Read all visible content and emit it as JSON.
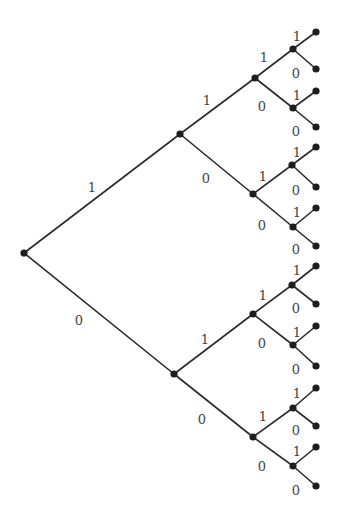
{
  "diagram": {
    "type": "binary-tree",
    "orientation": "left-to-right",
    "depth": 4,
    "colors": {
      "edge": "#2a2a2a",
      "node": "#1e1e1e",
      "label": "#444444"
    },
    "nodes": [
      {
        "id": "r",
        "x": 24,
        "y": 253
      },
      {
        "id": "1",
        "x": 180,
        "y": 134
      },
      {
        "id": "0",
        "x": 174,
        "y": 374
      },
      {
        "id": "11",
        "x": 255,
        "y": 78
      },
      {
        "id": "10",
        "x": 253,
        "y": 194
      },
      {
        "id": "01",
        "x": 253,
        "y": 314
      },
      {
        "id": "00",
        "x": 253,
        "y": 437
      },
      {
        "id": "111",
        "x": 293,
        "y": 49
      },
      {
        "id": "110",
        "x": 293,
        "y": 108
      },
      {
        "id": "101",
        "x": 292,
        "y": 165
      },
      {
        "id": "100",
        "x": 293,
        "y": 227
      },
      {
        "id": "011",
        "x": 292,
        "y": 285
      },
      {
        "id": "010",
        "x": 293,
        "y": 345
      },
      {
        "id": "001",
        "x": 293,
        "y": 408
      },
      {
        "id": "000",
        "x": 293,
        "y": 466
      },
      {
        "id": "1111",
        "x": 316,
        "y": 32
      },
      {
        "id": "1110",
        "x": 316,
        "y": 69
      },
      {
        "id": "1101",
        "x": 316,
        "y": 91
      },
      {
        "id": "1100",
        "x": 316,
        "y": 127
      },
      {
        "id": "1011",
        "x": 316,
        "y": 147
      },
      {
        "id": "1010",
        "x": 316,
        "y": 187
      },
      {
        "id": "1001",
        "x": 316,
        "y": 208
      },
      {
        "id": "1000",
        "x": 316,
        "y": 246
      },
      {
        "id": "0111",
        "x": 316,
        "y": 266
      },
      {
        "id": "0110",
        "x": 316,
        "y": 304
      },
      {
        "id": "0101",
        "x": 316,
        "y": 326
      },
      {
        "id": "0100",
        "x": 316,
        "y": 366
      },
      {
        "id": "0011",
        "x": 316,
        "y": 388
      },
      {
        "id": "0010",
        "x": 316,
        "y": 426
      },
      {
        "id": "0001",
        "x": 316,
        "y": 447
      },
      {
        "id": "0000",
        "x": 316,
        "y": 486
      }
    ],
    "edges": [
      {
        "from": "r",
        "to": "1",
        "label": "1",
        "lx": 92,
        "ly": 188
      },
      {
        "from": "r",
        "to": "0",
        "label": "0",
        "lx": 79,
        "ly": 321
      },
      {
        "from": "1",
        "to": "11",
        "label": "1",
        "lx": 207,
        "ly": 101
      },
      {
        "from": "1",
        "to": "10",
        "label": "0",
        "lx": 206,
        "ly": 179
      },
      {
        "from": "0",
        "to": "01",
        "label": "1",
        "lx": 205,
        "ly": 340
      },
      {
        "from": "0",
        "to": "00",
        "label": "0",
        "lx": 202,
        "ly": 420
      },
      {
        "from": "11",
        "to": "111",
        "label": "1",
        "lx": 264,
        "ly": 58
      },
      {
        "from": "11",
        "to": "110",
        "label": "0",
        "lx": 262,
        "ly": 107
      },
      {
        "from": "10",
        "to": "101",
        "label": "1",
        "lx": 263,
        "ly": 177
      },
      {
        "from": "10",
        "to": "100",
        "label": "0",
        "lx": 262,
        "ly": 226
      },
      {
        "from": "01",
        "to": "011",
        "label": "1",
        "lx": 263,
        "ly": 296
      },
      {
        "from": "01",
        "to": "010",
        "label": "0",
        "lx": 262,
        "ly": 344
      },
      {
        "from": "00",
        "to": "001",
        "label": "1",
        "lx": 263,
        "ly": 417
      },
      {
        "from": "00",
        "to": "000",
        "label": "0",
        "lx": 262,
        "ly": 467
      },
      {
        "from": "111",
        "to": "1111",
        "label": "1",
        "lx": 297,
        "ly": 37
      },
      {
        "from": "111",
        "to": "1110",
        "label": "0",
        "lx": 296,
        "ly": 74
      },
      {
        "from": "110",
        "to": "1101",
        "label": "1",
        "lx": 297,
        "ly": 96
      },
      {
        "from": "110",
        "to": "1100",
        "label": "0",
        "lx": 296,
        "ly": 132
      },
      {
        "from": "101",
        "to": "1011",
        "label": "1",
        "lx": 297,
        "ly": 153
      },
      {
        "from": "101",
        "to": "1010",
        "label": "0",
        "lx": 296,
        "ly": 191
      },
      {
        "from": "100",
        "to": "1001",
        "label": "1",
        "lx": 297,
        "ly": 213
      },
      {
        "from": "100",
        "to": "1000",
        "label": "0",
        "lx": 296,
        "ly": 250
      },
      {
        "from": "011",
        "to": "0111",
        "label": "1",
        "lx": 297,
        "ly": 271
      },
      {
        "from": "011",
        "to": "0110",
        "label": "0",
        "lx": 296,
        "ly": 309
      },
      {
        "from": "010",
        "to": "0101",
        "label": "1",
        "lx": 297,
        "ly": 333
      },
      {
        "from": "010",
        "to": "0100",
        "label": "0",
        "lx": 296,
        "ly": 370
      },
      {
        "from": "001",
        "to": "0011",
        "label": "1",
        "lx": 297,
        "ly": 394
      },
      {
        "from": "001",
        "to": "0010",
        "label": "0",
        "lx": 296,
        "ly": 431
      },
      {
        "from": "000",
        "to": "0001",
        "label": "1",
        "lx": 297,
        "ly": 452
      },
      {
        "from": "000",
        "to": "0000",
        "label": "0",
        "lx": 296,
        "ly": 491
      }
    ]
  }
}
